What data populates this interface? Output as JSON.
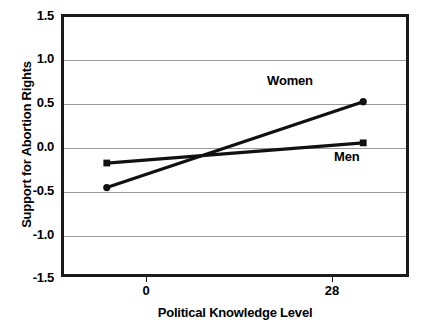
{
  "chart_data": {
    "type": "line",
    "title": "",
    "xlabel": "Political Knowledge Level",
    "ylabel": "Support for Abortion Rights",
    "x": [
      0,
      28
    ],
    "xtick_labels": [
      "0",
      "28"
    ],
    "xlim": [
      -5,
      33
    ],
    "ylim": [
      -1.5,
      1.5
    ],
    "ytick_labels": [
      "1.5",
      "1.0",
      "0.5",
      "0.0",
      "-0.5",
      "-1.0",
      "-1.5"
    ],
    "ytick_values": [
      1.5,
      1.0,
      0.5,
      0.0,
      -0.5,
      -1.0,
      -1.5
    ],
    "grid": true,
    "legend_position": "inline-annotations",
    "series": [
      {
        "name": "Women",
        "marker": "circle",
        "color": "#111111",
        "values": [
          -0.48,
          0.5
        ]
      },
      {
        "name": "Men",
        "marker": "square",
        "color": "#111111",
        "values": [
          -0.2,
          0.03
        ]
      }
    ],
    "annotations": [
      {
        "text": "Women",
        "x": 20.0,
        "y": 0.75
      },
      {
        "text": "Men",
        "x": 26.2,
        "y": -0.12
      }
    ]
  },
  "axes": {
    "frame_color": "#1a1a1a",
    "grid_color": "#9a9a9a",
    "background": "#ffffff"
  }
}
